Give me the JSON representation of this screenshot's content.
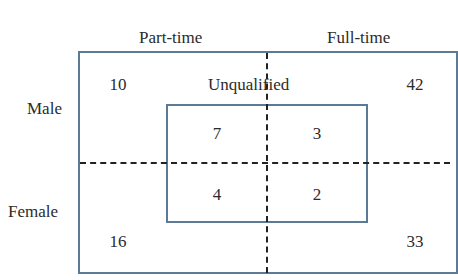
{
  "diagram": {
    "columns": [
      "Part-time",
      "Full-time"
    ],
    "rows": [
      "Male",
      "Female"
    ],
    "inner_label": "Unqualified",
    "outer_counts": {
      "male_part_time": "10",
      "male_full_time": "42",
      "female_part_time": "16",
      "female_full_time": "33"
    },
    "inner_counts": {
      "male_part_time": "7",
      "male_full_time": "3",
      "female_part_time": "4",
      "female_full_time": "2"
    },
    "colors": {
      "border": "#5a7a96",
      "dash": "#222222",
      "text": "#2b2b2b"
    }
  }
}
